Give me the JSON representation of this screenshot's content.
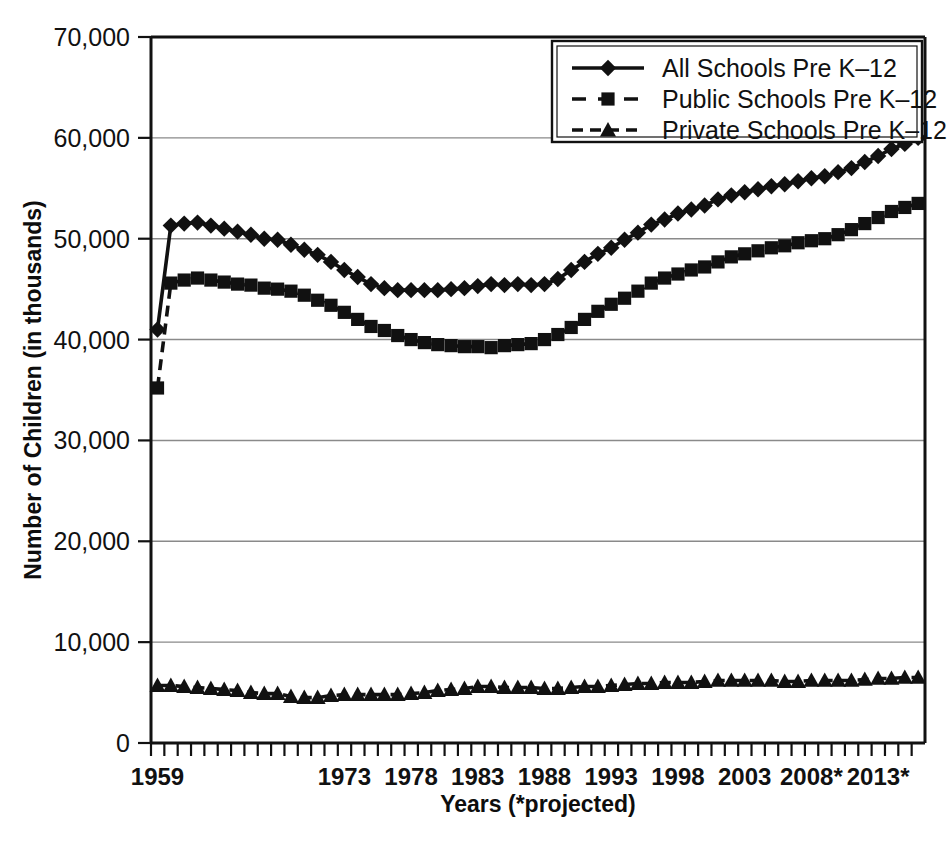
{
  "chart_data": {
    "type": "line",
    "title": "",
    "xlabel": "Years (*projected)",
    "ylabel": "Number of Children (in thousands)",
    "ylim": [
      0,
      70000
    ],
    "ytick_labels": [
      "70,000",
      "60,000",
      "50,000",
      "40,000",
      "30,000",
      "20,000",
      "10,000",
      "0"
    ],
    "ytick_values": [
      70000,
      60000,
      50000,
      40000,
      30000,
      20000,
      10000,
      0
    ],
    "xtick_labels": [
      "1959",
      "1973",
      "1978",
      "1983",
      "1988",
      "1993",
      "1998",
      "2003",
      "2008*",
      "2013*"
    ],
    "xtick_values": [
      1959,
      1973,
      1978,
      1983,
      1988,
      1993,
      1998,
      2003,
      2008,
      2013
    ],
    "grid": "horizontal",
    "legend_position": "top-right",
    "x": [
      1959,
      1960,
      1961,
      1962,
      1963,
      1964,
      1965,
      1966,
      1967,
      1968,
      1969,
      1970,
      1971,
      1972,
      1973,
      1974,
      1975,
      1976,
      1977,
      1978,
      1979,
      1980,
      1981,
      1982,
      1983,
      1984,
      1985,
      1986,
      1987,
      1988,
      1989,
      1990,
      1991,
      1992,
      1993,
      1994,
      1995,
      1996,
      1997,
      1998,
      1999,
      2000,
      2001,
      2002,
      2003,
      2004,
      2005,
      2006,
      2007,
      2008,
      2009,
      2010,
      2011,
      2012,
      2013,
      2014,
      2015,
      2016
    ],
    "series": [
      {
        "name": "All Schools Pre K-12",
        "marker": "diamond",
        "linestyle": "solid",
        "values": [
          41000,
          51300,
          51500,
          51600,
          51300,
          51000,
          50700,
          50400,
          50000,
          49900,
          49400,
          48900,
          48400,
          47700,
          46900,
          46200,
          45500,
          45100,
          44900,
          44900,
          44900,
          44900,
          45000,
          45100,
          45300,
          45500,
          45400,
          45500,
          45400,
          45500,
          46000,
          46900,
          47700,
          48500,
          49100,
          49900,
          50600,
          51400,
          51900,
          52500,
          52900,
          53300,
          53900,
          54300,
          54600,
          54900,
          55200,
          55400,
          55700,
          56000,
          56200,
          56600,
          57000,
          57600,
          58200,
          58900,
          59400,
          60000
        ],
        "color": "#111111"
      },
      {
        "name": "Public Schools Pre K-12",
        "marker": "square",
        "linestyle": "dashed",
        "values": [
          35200,
          45600,
          45900,
          46100,
          45900,
          45700,
          45500,
          45400,
          45100,
          45000,
          44800,
          44400,
          43900,
          43400,
          42700,
          42000,
          41300,
          40900,
          40400,
          40000,
          39700,
          39500,
          39400,
          39300,
          39300,
          39200,
          39400,
          39500,
          39600,
          40000,
          40500,
          41200,
          42000,
          42800,
          43500,
          44100,
          44800,
          45600,
          46100,
          46500,
          46900,
          47200,
          47700,
          48200,
          48500,
          48800,
          49100,
          49300,
          49600,
          49800,
          50000,
          50400,
          50900,
          51500,
          52100,
          52700,
          53100,
          53500
        ],
        "color": "#111111"
      },
      {
        "name": "Private Schools Pre K-12",
        "marker": "triangle",
        "linestyle": "dashed",
        "values": [
          5700,
          5700,
          5600,
          5500,
          5400,
          5300,
          5200,
          5000,
          4900,
          4900,
          4600,
          4500,
          4500,
          4700,
          4800,
          4800,
          4800,
          4800,
          4800,
          4900,
          5000,
          5200,
          5300,
          5400,
          5600,
          5600,
          5500,
          5500,
          5500,
          5400,
          5400,
          5500,
          5600,
          5600,
          5700,
          5800,
          5900,
          5900,
          6000,
          6000,
          6000,
          6100,
          6200,
          6200,
          6200,
          6200,
          6200,
          6100,
          6100,
          6200,
          6200,
          6200,
          6200,
          6300,
          6400,
          6400,
          6500,
          6500
        ],
        "color": "#111111"
      }
    ]
  },
  "legend": {
    "items": [
      {
        "label": "All Schools Pre K–12",
        "marker": "diamond",
        "linestyle": "solid"
      },
      {
        "label": "Public Schools Pre K–12",
        "marker": "square",
        "linestyle": "dashed"
      },
      {
        "label": "Private Schools Pre K–12",
        "marker": "triangle",
        "linestyle": "dashed"
      }
    ]
  },
  "axes": {
    "y_title": "Number of Children (in thousands)",
    "x_title": "Years (*projected)"
  }
}
